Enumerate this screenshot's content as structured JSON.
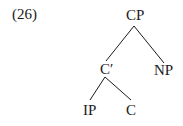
{
  "example_number": "(26)",
  "tree": {
    "root": "CP",
    "c_bar": "C′",
    "np": "NP",
    "ip": "IP",
    "c": "C"
  },
  "edges": [
    [
      "CP",
      "C′"
    ],
    [
      "CP",
      "NP"
    ],
    [
      "C′",
      "IP"
    ],
    [
      "C′",
      "C"
    ]
  ]
}
